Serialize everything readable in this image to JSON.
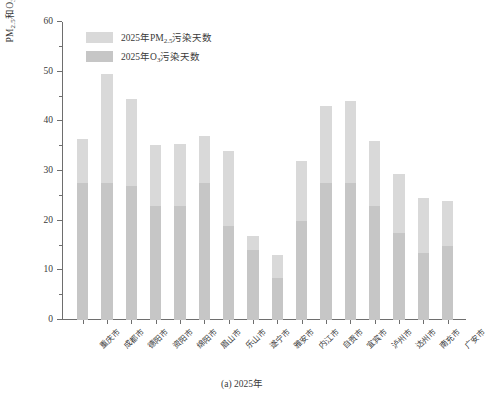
{
  "chart_data": {
    "type": "bar",
    "subtype": "stacked-vertical-bar",
    "title": "",
    "caption": "(a) 2025年",
    "xlabel": "",
    "ylabel": "PM2.5和O3污染天数/d",
    "ylabel_parts": {
      "prefix": "PM",
      "sub1": "2.5",
      "mid": "和O",
      "sub2": "3",
      "suffix": "污染天数/d"
    },
    "ylim": [
      0,
      60
    ],
    "ytick_major": [
      0,
      10,
      20,
      30,
      40,
      50,
      60
    ],
    "ytick_minor": [
      5,
      15,
      25,
      35,
      45,
      55
    ],
    "ytick_labels": [
      "0",
      "10",
      "20",
      "30",
      "40",
      "50",
      "60"
    ],
    "grid": false,
    "legend_position": "upper-left-inside",
    "categories": [
      "重庆市",
      "成都市",
      "德阳市",
      "资阳市",
      "绵阳市",
      "眉山市",
      "乐山市",
      "遂宁市",
      "雅安市",
      "内江市",
      "自贡市",
      "宜宾市",
      "泸州市",
      "达州市",
      "南充市",
      "广安市"
    ],
    "series": [
      {
        "name": "2025年PM2.5污染天数",
        "label_parts": {
          "prefix": "2025年PM",
          "sub": "2.5",
          "suffix": "污染天数"
        },
        "color": "#d9d9d9",
        "stack_role": "upper",
        "values": [
          9.0,
          22.0,
          17.5,
          12.2,
          12.5,
          9.5,
          15.0,
          3.0,
          4.5,
          12.0,
          15.5,
          16.5,
          13.0,
          12.0,
          11.0,
          9.0
        ]
      },
      {
        "name": "2025年O3污染天数",
        "label_parts": {
          "prefix": "2025年O",
          "sub": "3",
          "suffix": "污染天数"
        },
        "color": "#c6c6c6",
        "stack_role": "lower",
        "values": [
          27.5,
          27.5,
          27.0,
          23.0,
          23.0,
          27.5,
          19.0,
          14.0,
          8.5,
          20.0,
          27.5,
          27.5,
          23.0,
          17.5,
          13.5,
          15.0
        ]
      }
    ],
    "totals": [
      36.5,
      49.5,
      44.5,
      35.2,
      35.5,
      37.0,
      34.0,
      17.0,
      13.0,
      32.0,
      43.0,
      44.0,
      36.0,
      29.5,
      24.5,
      24.0
    ]
  }
}
